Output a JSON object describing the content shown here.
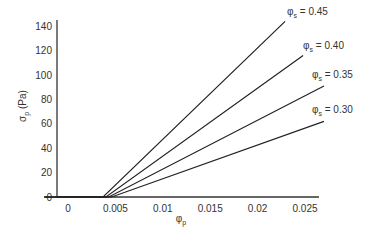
{
  "chart_data": {
    "type": "line",
    "title": "",
    "xlabel": "φp",
    "ylabel": "σp (Pa)",
    "xlim": [
      -0.0025,
      0.0264
    ],
    "ylim": [
      0,
      140
    ],
    "x_ticks": [
      "0",
      "0.005",
      "0.01",
      "0.015",
      "0.02",
      "0.025"
    ],
    "x_tick_values": [
      0,
      0.005,
      0.01,
      0.015,
      0.02,
      0.025
    ],
    "y_ticks": [
      "0",
      "20",
      "40",
      "60",
      "80",
      "100",
      "120",
      "140"
    ],
    "y_tick_values": [
      0,
      20,
      40,
      60,
      80,
      100,
      120,
      140
    ],
    "grid": false,
    "legend": "inline labels at line ends",
    "series": [
      {
        "name": "φs = 0.45",
        "label_sym": "φ",
        "label_sub": "s",
        "label_val": " = 0.45",
        "x": [
          -0.0025,
          0.0037,
          0.0229
        ],
        "y": [
          0,
          0,
          144
        ]
      },
      {
        "name": "φs = 0.40",
        "label_sym": "φ",
        "label_sub": "s",
        "label_val": " = 0.40",
        "x": [
          -0.0025,
          0.004,
          0.0248
        ],
        "y": [
          0,
          0,
          116
        ]
      },
      {
        "name": "φs = 0.35",
        "label_sym": "φ",
        "label_sub": "s",
        "label_val": " = 0.35",
        "x": [
          -0.0025,
          0.0043,
          0.027
        ],
        "y": [
          0,
          0,
          91
        ]
      },
      {
        "name": "φs = 0.30",
        "label_sym": "φ",
        "label_sub": "s",
        "label_val": " = 0.30",
        "x": [
          -0.0025,
          0.0046,
          0.027
        ],
        "y": [
          0,
          0,
          62
        ]
      }
    ]
  },
  "axes": {
    "xlabel_sym": "φ",
    "xlabel_sub": "p",
    "ylabel_sym": "σ",
    "ylabel_sub": "p",
    "ylabel_unit": " (Pa)"
  }
}
